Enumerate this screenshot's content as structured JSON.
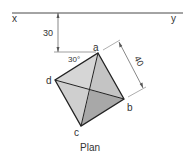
{
  "diagram": {
    "title": "Plan",
    "ground_line": {
      "left_label": "x",
      "right_label": "y"
    },
    "distance_label": "30",
    "angle_label": "30°",
    "side_label": "40",
    "vertices": {
      "a": "a",
      "b": "b",
      "c": "c",
      "d": "d"
    },
    "colors": {
      "line": "#222222",
      "face_light": "#d6d6d6",
      "face_mid": "#c4c4c4",
      "face_dark": "#a8a8a8",
      "dim": "#555555"
    }
  }
}
